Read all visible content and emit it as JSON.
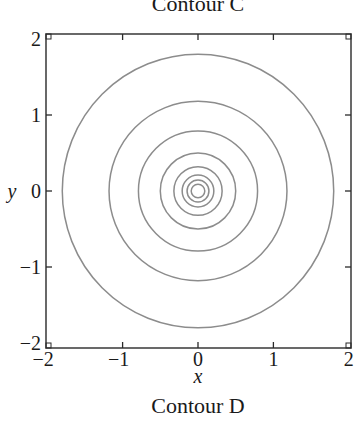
{
  "chart_data": {
    "type": "contour",
    "title_top": "Contour C",
    "title": "Contour D",
    "xlabel": "x",
    "ylabel": "y",
    "xlim": [
      -2,
      2
    ],
    "ylim": [
      -2,
      2
    ],
    "x_ticks": [
      -2,
      -1,
      0,
      1,
      2
    ],
    "y_ticks": [
      -2,
      -1,
      0,
      1,
      2
    ],
    "x_tick_labels": [
      "−2",
      "−1",
      "0",
      "1",
      "2"
    ],
    "y_tick_labels": [
      "−2",
      "−1",
      "0",
      "1",
      "2"
    ],
    "grid": false,
    "legend": null,
    "center": [
      0,
      0
    ],
    "contour_radii": [
      1.8,
      1.18,
      0.79,
      0.5,
      0.32,
      0.21,
      0.145,
      0.09
    ],
    "line_color": "#8c8c8c",
    "frame_color": "#2a2a2a"
  }
}
